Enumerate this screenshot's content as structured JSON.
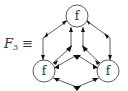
{
  "diagram": {
    "label": {
      "symbol": "F",
      "subscript": "3",
      "relation": "≡"
    },
    "nodes": [
      {
        "id": "top",
        "label": "f",
        "cx": 77,
        "cy": 16
      },
      {
        "id": "bottom-left",
        "label": "f",
        "cx": 44,
        "cy": 71
      },
      {
        "id": "bottom-right",
        "label": "f",
        "cx": 108,
        "cy": 71
      }
    ],
    "colors": {
      "stroke": "#333333",
      "node_fill": "#ffffff",
      "arrow_fill": "#111111"
    }
  }
}
